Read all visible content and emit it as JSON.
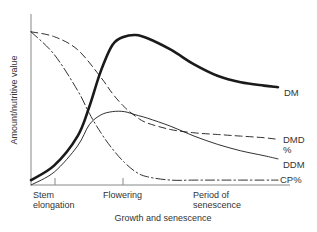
{
  "chart_data": {
    "type": "line",
    "title": "",
    "xlabel": "Growth and senescence",
    "ylabel": "Amount/nutritive value",
    "x_ticks": [
      {
        "label_lines": [
          "Stem",
          "elongation"
        ],
        "x": 1
      },
      {
        "label_lines": [
          "Flowering"
        ],
        "x": 4
      },
      {
        "label_lines": [
          "Period of",
          "senescence"
        ],
        "x": 7
      }
    ],
    "xlim": [
      0,
      11
    ],
    "ylim": [
      0,
      100
    ],
    "grid": false,
    "legend": "inline-right",
    "series": [
      {
        "name": "DM",
        "label": "DM",
        "style": "solid-thick",
        "x": [
          0,
          1,
          2,
          2.5,
          3,
          3.5,
          4,
          4.5,
          5,
          6,
          7,
          8,
          9,
          10,
          10.6
        ],
        "values": [
          3,
          12,
          30,
          48,
          70,
          86,
          91,
          92,
          90,
          83,
          74,
          67,
          63,
          61,
          60
        ]
      },
      {
        "name": "DMD%",
        "label_lines": [
          "DMD",
          "%"
        ],
        "style": "dashed",
        "x": [
          0,
          1,
          2,
          3,
          3.5,
          4,
          4.5,
          5,
          6,
          7,
          8,
          9,
          10,
          10.6
        ],
        "values": [
          94,
          91,
          83,
          66,
          56,
          48,
          42,
          38,
          34,
          32,
          31,
          30,
          29,
          28
        ]
      },
      {
        "name": "DDM",
        "label": "DDM",
        "style": "solid-thin",
        "x": [
          0,
          1,
          2,
          2.5,
          3,
          3.5,
          4,
          4.5,
          5,
          6,
          7,
          8,
          9,
          10,
          10.6
        ],
        "values": [
          0,
          8,
          24,
          37,
          43,
          45,
          45,
          43,
          41,
          36,
          30,
          25,
          21,
          18,
          16
        ]
      },
      {
        "name": "CP%",
        "label": "CP%",
        "style": "dash-dot",
        "x": [
          0,
          1,
          2,
          2.5,
          3,
          3.5,
          4,
          4.5,
          5,
          6,
          7,
          8,
          9,
          10,
          10.6
        ],
        "values": [
          94,
          80,
          58,
          44,
          32,
          22,
          14,
          8,
          5,
          3,
          3,
          3,
          3,
          3,
          3
        ]
      }
    ]
  }
}
